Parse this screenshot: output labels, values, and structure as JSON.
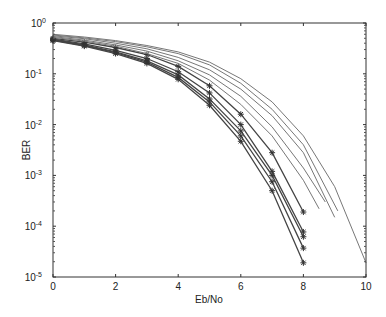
{
  "chart_data": {
    "type": "line",
    "title": "",
    "xlabel": "Eb/No",
    "ylabel": "BER",
    "xlim": [
      0,
      10
    ],
    "ylim": [
      1e-05,
      1
    ],
    "yscale": "log",
    "grid": false,
    "legend": null,
    "x_ticks": [
      0,
      2,
      4,
      6,
      8,
      10
    ],
    "x_tick_labels": [
      "0",
      "2",
      "4",
      "6",
      "8",
      "10"
    ],
    "y_ticks": [
      1,
      0.1,
      0.01,
      0.001,
      0.0001,
      1e-05
    ],
    "y_tick_labels": [
      {
        "base": "10",
        "exp": "0"
      },
      {
        "base": "10",
        "exp": "-1"
      },
      {
        "base": "10",
        "exp": "-2"
      },
      {
        "base": "10",
        "exp": "-3"
      },
      {
        "base": "10",
        "exp": "-4"
      },
      {
        "base": "10",
        "exp": "-5"
      }
    ],
    "series": [
      {
        "name": "simulated-1",
        "marker": "*",
        "x": [
          0,
          1,
          2,
          3,
          4,
          5,
          6,
          7,
          8
        ],
        "y": [
          0.5,
          0.42,
          0.33,
          0.24,
          0.14,
          0.058,
          0.016,
          0.0028,
          0.00019
        ]
      },
      {
        "name": "simulated-2",
        "marker": "*",
        "x": [
          0,
          1,
          2,
          3,
          4,
          5,
          6,
          7,
          8
        ],
        "y": [
          0.48,
          0.39,
          0.29,
          0.2,
          0.11,
          0.042,
          0.01,
          0.0012,
          7.7e-05
        ]
      },
      {
        "name": "simulated-3",
        "marker": "*",
        "x": [
          0,
          1,
          2,
          3,
          4,
          5,
          6,
          7,
          8
        ],
        "y": [
          0.47,
          0.37,
          0.27,
          0.18,
          0.095,
          0.032,
          0.0075,
          0.001,
          6.2e-05
        ]
      },
      {
        "name": "simulated-4",
        "marker": "*",
        "x": [
          0,
          1,
          2,
          3,
          4,
          5,
          6,
          7,
          8
        ],
        "y": [
          0.46,
          0.36,
          0.26,
          0.17,
          0.085,
          0.028,
          0.006,
          0.00075,
          3.7e-05
        ]
      },
      {
        "name": "simulated-5",
        "marker": "*",
        "x": [
          0,
          1,
          2,
          3,
          4,
          5,
          6,
          7,
          8
        ],
        "y": [
          0.45,
          0.35,
          0.25,
          0.16,
          0.078,
          0.024,
          0.0047,
          0.0005,
          1.9e-05
        ]
      },
      {
        "name": "theoretical-1",
        "marker": "",
        "x": [
          0,
          1,
          2,
          3,
          4,
          5,
          6,
          7,
          8,
          8.5
        ],
        "y": [
          0.52,
          0.44,
          0.35,
          0.25,
          0.16,
          0.075,
          0.025,
          0.006,
          0.0008,
          0.00022
        ]
      },
      {
        "name": "theoretical-2",
        "marker": "",
        "x": [
          0,
          1,
          2,
          3,
          4,
          5,
          6,
          7,
          8,
          8.7
        ],
        "y": [
          0.54,
          0.46,
          0.37,
          0.28,
          0.18,
          0.095,
          0.036,
          0.009,
          0.0014,
          0.0003
        ]
      },
      {
        "name": "theoretical-3",
        "marker": "",
        "x": [
          0,
          1,
          2,
          3,
          4,
          5,
          6,
          7,
          8,
          9
        ],
        "y": [
          0.56,
          0.49,
          0.4,
          0.31,
          0.21,
          0.12,
          0.05,
          0.015,
          0.0028,
          0.00015
        ]
      },
      {
        "name": "theoretical-4",
        "marker": "",
        "x": [
          0,
          1,
          2,
          3,
          4,
          5,
          6,
          7,
          8,
          9.1
        ],
        "y": [
          0.58,
          0.51,
          0.43,
          0.34,
          0.25,
          0.15,
          0.065,
          0.02,
          0.004,
          0.0002
        ]
      },
      {
        "name": "theoretical-5",
        "marker": "",
        "x": [
          0,
          1,
          2,
          3,
          4,
          5,
          6,
          7,
          8,
          9,
          10
        ],
        "y": [
          0.6,
          0.53,
          0.45,
          0.36,
          0.27,
          0.17,
          0.08,
          0.028,
          0.006,
          0.0006,
          1.9e-05
        ]
      }
    ],
    "colors": {
      "axis": "#333333",
      "marked_lines": "#444444",
      "plain_lines": "#777777",
      "background": "#ffffff"
    }
  }
}
